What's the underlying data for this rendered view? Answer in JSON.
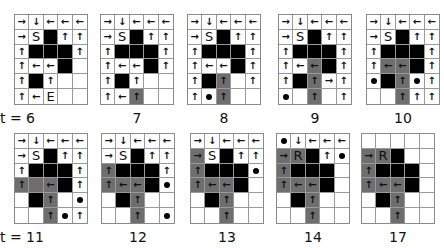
{
  "figure": {
    "colors": {
      "wall": "#000000",
      "path": "#6e6e6e",
      "empty": "#ffffff",
      "grid_line": "#9a9a9a"
    },
    "legend": {
      "S": "start",
      "E": "end",
      "R": "robot",
      "dot": "marker"
    },
    "panels": [
      {
        "label": "t = 6",
        "x": 14,
        "y": 14,
        "cells": [
          [
            "→",
            "↓",
            "←",
            "←",
            "←"
          ],
          [
            "→",
            "S",
            "#",
            "↑",
            "↑"
          ],
          [
            "↑",
            "#",
            "#",
            "#",
            "↑"
          ],
          [
            "↑",
            "←",
            "←",
            "#",
            ""
          ],
          [
            "↑",
            "#",
            "↑",
            "",
            ""
          ],
          [
            "↑",
            "←",
            "E",
            "",
            ""
          ]
        ]
      },
      {
        "label": "7",
        "x": 100,
        "y": 14,
        "cells": [
          [
            "→",
            "↓",
            "←",
            "←",
            "←"
          ],
          [
            "→",
            "S",
            "#",
            "↑",
            "↑"
          ],
          [
            "↑",
            "#",
            "#",
            "#",
            "↑"
          ],
          [
            "↑",
            "←",
            "←",
            "#",
            "↑"
          ],
          [
            "↑",
            "#",
            "↑",
            "",
            ""
          ],
          [
            "↑",
            "←",
            "P↑",
            "",
            ""
          ]
        ]
      },
      {
        "label": "8",
        "x": 187,
        "y": 14,
        "cells": [
          [
            "→",
            "↓",
            "←",
            "←",
            "←"
          ],
          [
            "→",
            "S",
            "#",
            "↑",
            "↑"
          ],
          [
            "↑",
            "#",
            "#",
            "#",
            "↑"
          ],
          [
            "↑",
            "←",
            "←",
            "#",
            "↑"
          ],
          [
            "↑",
            "#",
            "P↑",
            "",
            "↑"
          ],
          [
            "↑",
            "•",
            "P↑",
            "",
            ""
          ]
        ]
      },
      {
        "label": "9",
        "x": 278,
        "y": 14,
        "cells": [
          [
            "→",
            "↓",
            "←",
            "←",
            "←"
          ],
          [
            "→",
            "S",
            "#",
            "↑",
            "↑"
          ],
          [
            "↑",
            "#",
            "#",
            "#",
            "↑"
          ],
          [
            "↑",
            "←",
            "P←",
            "#",
            "↑"
          ],
          [
            "↑",
            "#",
            "P↑",
            "→",
            "↑"
          ],
          [
            "•",
            "",
            "P↑",
            "",
            "↑"
          ]
        ]
      },
      {
        "label": "10",
        "x": 366,
        "y": 14,
        "cells": [
          [
            "→",
            "↓",
            "←",
            "←",
            "←"
          ],
          [
            "→",
            "S",
            "#",
            "↑",
            "↑"
          ],
          [
            "↑",
            "#",
            "#",
            "#",
            "↑"
          ],
          [
            "↑",
            "P←",
            "P←",
            "#",
            "↑"
          ],
          [
            "•",
            "#",
            "P↑",
            "•",
            "↑"
          ],
          [
            "",
            "",
            "P↑",
            "↑",
            "↑"
          ]
        ]
      },
      {
        "label": "t = 11",
        "x": 14,
        "y": 133,
        "cells": [
          [
            "→",
            "↓",
            "←",
            "←",
            "←"
          ],
          [
            "→",
            "S",
            "#",
            "↑",
            "↑"
          ],
          [
            "↑",
            "#",
            "#",
            "#",
            "↑"
          ],
          [
            "P↑",
            "P",
            "P←",
            "#",
            "↑"
          ],
          [
            "",
            "#",
            "P↑",
            "",
            "•"
          ],
          [
            "",
            "",
            "P↑",
            "•",
            "↑"
          ]
        ]
      },
      {
        "label": "12",
        "x": 101,
        "y": 133,
        "cells": [
          [
            "→",
            "↓",
            "←",
            "←",
            "←"
          ],
          [
            "→",
            "S",
            "#",
            "↑",
            "↑"
          ],
          [
            "P↑",
            "#",
            "#",
            "#",
            "↑"
          ],
          [
            "P↑",
            "P←",
            "P←",
            "#",
            "•"
          ],
          [
            "",
            "#",
            "P↑",
            "",
            ""
          ],
          [
            "",
            "",
            "P↑",
            "",
            "•"
          ]
        ]
      },
      {
        "label": "13",
        "x": 190,
        "y": 133,
        "cells": [
          [
            "→",
            "↓",
            "←",
            "←",
            "←"
          ],
          [
            "P→",
            "S",
            "#",
            "↑",
            "↑"
          ],
          [
            "P↑",
            "#",
            "#",
            "#",
            "•"
          ],
          [
            "P↑",
            "P←",
            "P←",
            "#",
            ""
          ],
          [
            "",
            "#",
            "P↑",
            "",
            ""
          ],
          [
            "",
            "",
            "P↑",
            "",
            ""
          ]
        ]
      },
      {
        "label": "14",
        "x": 276,
        "y": 133,
        "cells": [
          [
            "•",
            "↓",
            "←",
            "←",
            "←"
          ],
          [
            "P→",
            "PR",
            "#",
            "↑",
            "•"
          ],
          [
            "P↑",
            "#",
            "#",
            "#",
            ""
          ],
          [
            "P↑",
            "P←",
            "P←",
            "#",
            ""
          ],
          [
            "",
            "#",
            "P↑",
            "",
            ""
          ],
          [
            "",
            "",
            "P↑",
            "",
            ""
          ]
        ]
      },
      {
        "label": "17",
        "x": 361,
        "y": 133,
        "cells": [
          [
            "",
            "",
            "",
            "",
            ""
          ],
          [
            "P→",
            "PR",
            "#",
            "",
            ""
          ],
          [
            "P↑",
            "#",
            "#",
            "#",
            ""
          ],
          [
            "P↑",
            "P←",
            "P←",
            "#",
            ""
          ],
          [
            "",
            "#",
            "P↑",
            "",
            ""
          ],
          [
            "",
            "",
            "P↑",
            "",
            ""
          ]
        ]
      }
    ]
  }
}
